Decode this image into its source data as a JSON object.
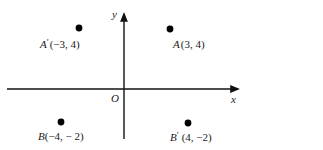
{
  "diagram": {
    "axes": {
      "x_label": "x",
      "y_label": "y",
      "origin_label": "O",
      "color": "#111111"
    },
    "points": [
      {
        "name": "A′",
        "letter": "A",
        "prime": "′",
        "coords_text": "(−3, 4)",
        "x": -3,
        "y": 4
      },
      {
        "name": "A",
        "letter": "A",
        "prime": "",
        "coords_text": "(3, 4)",
        "x": 3,
        "y": 4
      },
      {
        "name": "B",
        "letter": "B",
        "prime": "",
        "coords_text": "(−4, − 2)",
        "x": -4,
        "y": -2
      },
      {
        "name": "B′",
        "letter": "B",
        "prime": "′",
        "coords_text": "(4, −2)",
        "x": 4,
        "y": -2
      }
    ],
    "point_color": "#000000"
  }
}
